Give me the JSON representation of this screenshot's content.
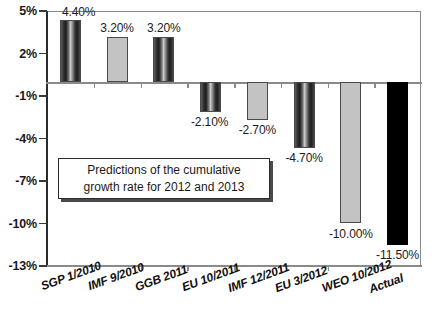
{
  "chart_data": {
    "type": "bar",
    "title": "",
    "xlabel": "",
    "ylabel": "",
    "ylim": [
      -13,
      5
    ],
    "yticks": [
      "5%",
      "2%",
      "-1%",
      "-4%",
      "-7%",
      "-10%",
      "-13%"
    ],
    "ytick_values": [
      5,
      2,
      -1,
      -4,
      -7,
      -10,
      -13
    ],
    "grid": false,
    "legend": "none",
    "categories": [
      "SGP 1/2010",
      "IMF 9/2010",
      "GGB 2011",
      "EU 10/2011",
      "IMF 12/2011",
      "EU 3/2012",
      "WEO 10/2012",
      "Actual"
    ],
    "values": [
      4.4,
      3.2,
      3.2,
      -2.1,
      -2.7,
      -4.7,
      -10.0,
      -11.5
    ],
    "data_labels": [
      "4.40%",
      "3.20%",
      "3.20%",
      "-2.10%",
      "-2.70%",
      "-4.70%",
      "-10.00%",
      "-11.50%"
    ],
    "bar_styles": [
      "gradient",
      "flat-gray",
      "gradient",
      "gradient",
      "flat-gray",
      "gradient",
      "flat-gray",
      "solid-black"
    ],
    "annotations": [
      {
        "name": "prediction-note",
        "line1": "Predictions of the cumulative",
        "line2": "growth rate for 2012 and 2013"
      }
    ],
    "colors": {
      "flat_gray": "#c3c3c3",
      "solid_black": "#000000",
      "axis": "#8a8a8a",
      "text": "#1a1a1a"
    }
  }
}
